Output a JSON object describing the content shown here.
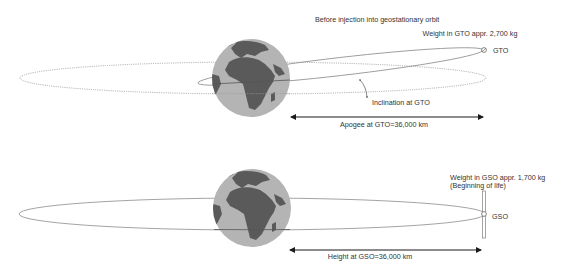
{
  "top_panel": {
    "title": "Before injection into geostationary orbit",
    "weight_label": "Weight in GTO appr. 2,700 kg",
    "orbit_label": "GTO",
    "inclination_label": "Inclination at GTO",
    "distance_label": "Apogee at GTO=36,000 km"
  },
  "bottom_panel": {
    "weight_label_line1": "Weight in GSO appr. 1,700 kg",
    "weight_label_line2": "(Beginning of life)",
    "orbit_label": "GSO",
    "distance_label": "Height at GSO=36,000 km"
  },
  "colors": {
    "ocean": "#b4b4b4",
    "land": "#5a5a5a",
    "orbit_line": "#8c8c8c",
    "arrow": "#1a1a1a",
    "text": "#333333"
  }
}
